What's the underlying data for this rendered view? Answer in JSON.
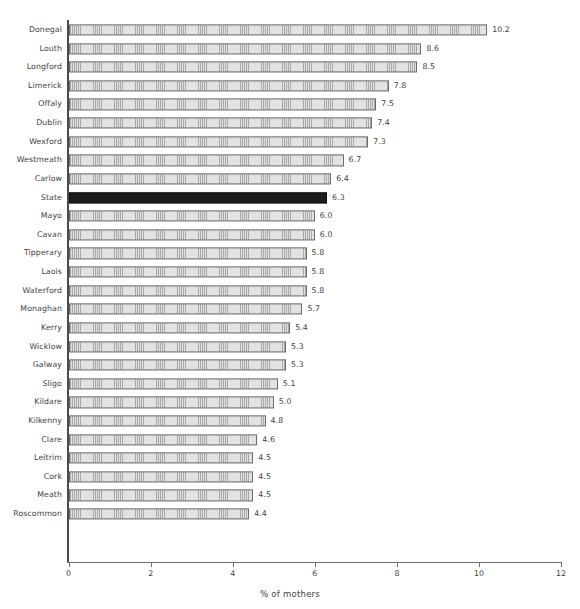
{
  "chart_data": {
    "type": "bar",
    "orientation": "horizontal",
    "title": "",
    "subtitle": "",
    "xlabel": "% of mothers",
    "ylabel": "",
    "xlim": [
      0,
      12
    ],
    "xticks": [
      0,
      2,
      4,
      6,
      8,
      10,
      12
    ],
    "xtick_labels": [
      "0",
      "2",
      "4",
      "6",
      "8",
      "10",
      "12"
    ],
    "grid": false,
    "legend": null,
    "highlight_category": "State",
    "highlight_color": "#1c1c1c",
    "bar_fill_color": "#e2e2e2",
    "bar_edge_color": "#6b6b6b",
    "text_color": "#404040",
    "axis_color": "#6e6e6e",
    "categories": [
      "Donegal",
      "Louth",
      "Longford",
      "Limerick",
      "Offaly",
      "Dublin",
      "Wexford",
      "Westmeath",
      "Carlow",
      "State",
      "Mayo",
      "Cavan",
      "Tipperary",
      "Laois",
      "Waterford",
      "Monaghan",
      "Kerry",
      "Wicklow",
      "Galway",
      "Sligo",
      "Kildare",
      "Kilkenny",
      "Clare",
      "Leitrim",
      "Cork",
      "Meath",
      "Roscommon"
    ],
    "values": [
      10.2,
      8.6,
      8.5,
      7.8,
      7.5,
      7.4,
      7.3,
      6.7,
      6.4,
      6.3,
      6.0,
      6.0,
      5.8,
      5.8,
      5.8,
      5.7,
      5.4,
      5.3,
      5.3,
      5.1,
      5.0,
      4.8,
      4.6,
      4.5,
      4.5,
      4.5,
      4.4
    ],
    "value_labels": [
      "10.2",
      "8.6",
      "8.5",
      "7.8",
      "7.5",
      "7.4",
      "7.3",
      "6.7",
      "6.4",
      "6.3",
      "6.0",
      "6.0",
      "5.8",
      "5.8",
      "5.8",
      "5.7",
      "5.4",
      "5.3",
      "5.3",
      "5.1",
      "5.0",
      "4.8",
      "4.6",
      "4.5",
      "4.5",
      "4.5",
      "4.4"
    ]
  }
}
